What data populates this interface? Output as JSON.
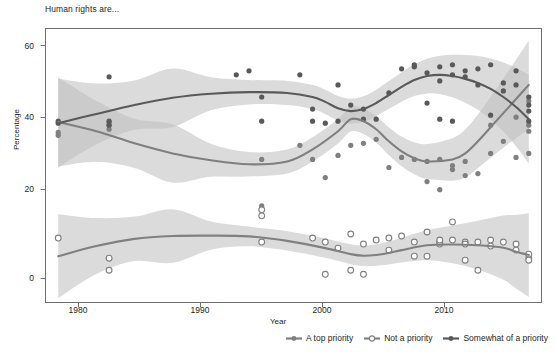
{
  "chart": {
    "title": "Human rights are...",
    "xlabel": "Year",
    "ylabel": "Percentage"
  },
  "axes": {
    "y_ticks": [
      "0",
      "20",
      "40",
      "60"
    ],
    "x_ticks": [
      "1980",
      "1990",
      "2000",
      "2010"
    ]
  },
  "legend": [
    {
      "label": "A top priority",
      "marker": "filled-circle-medium-gray",
      "color": "#7f7f7f"
    },
    {
      "label": "Not a priority",
      "marker": "open-circle",
      "color": "#808080"
    },
    {
      "label": "Somewhat of a priority",
      "marker": "filled-circle-dark-gray",
      "color": "#595959"
    }
  ],
  "chart_data": {
    "type": "scatter",
    "title": "Human rights are...",
    "xlabel": "Year",
    "ylabel": "Percentage",
    "xlim": [
      1978,
      2017
    ],
    "ylim": [
      -2,
      66
    ],
    "grid": false,
    "legend_position": "bottom-right",
    "smoother": "loess with shaded 95% confidence band",
    "series": [
      {
        "name": "A top priority",
        "color": "#7f7f7f",
        "marker": "filled-circle",
        "points": [
          [
            1979,
            39.5
          ],
          [
            1979,
            40.2
          ],
          [
            1983,
            42.0
          ],
          [
            1983,
            41.0
          ],
          [
            1983,
            42.8
          ],
          [
            1995,
            33.5
          ],
          [
            1995,
            22.0
          ],
          [
            1998,
            37.0
          ],
          [
            1999,
            33.5
          ],
          [
            2000,
            29.0
          ],
          [
            2001,
            34.5
          ],
          [
            2002,
            37.0
          ],
          [
            2003,
            37.5
          ],
          [
            2004,
            38.5
          ],
          [
            2005,
            31.5
          ],
          [
            2006,
            34.0
          ],
          [
            2007,
            33.5
          ],
          [
            2008,
            28.0
          ],
          [
            2008,
            33.0
          ],
          [
            2009,
            33.5
          ],
          [
            2009,
            26.0
          ],
          [
            2010,
            31.0
          ],
          [
            2010,
            32.0
          ],
          [
            2011,
            29.5
          ],
          [
            2011,
            33.0
          ],
          [
            2012,
            30.0
          ],
          [
            2013,
            35.0
          ],
          [
            2013,
            42.0
          ],
          [
            2014,
            38.0
          ],
          [
            2015,
            44.0
          ],
          [
            2015,
            34.0
          ],
          [
            2016,
            48.0
          ],
          [
            2016,
            42.0
          ],
          [
            2016,
            35.0
          ],
          [
            2016,
            40.5
          ]
        ],
        "trend": [
          [
            1979,
            42.8
          ],
          [
            1982,
            40.5
          ],
          [
            1985,
            37.5
          ],
          [
            1988,
            35.0
          ],
          [
            1991,
            33.3
          ],
          [
            1994,
            32.3
          ],
          [
            1997,
            33.0
          ],
          [
            1999,
            36.0
          ],
          [
            2001,
            40.5
          ],
          [
            2002,
            43.5
          ],
          [
            2003,
            43.0
          ],
          [
            2004,
            41.0
          ],
          [
            2005,
            38.0
          ],
          [
            2006,
            35.5
          ],
          [
            2007,
            33.8
          ],
          [
            2008,
            33.0
          ],
          [
            2010,
            33.5
          ],
          [
            2011,
            35.0
          ],
          [
            2012,
            38.0
          ],
          [
            2013,
            41.5
          ],
          [
            2014,
            45.0
          ],
          [
            2015,
            48.5
          ],
          [
            2016,
            52.0
          ]
        ]
      },
      {
        "name": "Not a priority",
        "color": "#808080",
        "marker": "open-circle",
        "points": [
          [
            1979,
            14.0
          ],
          [
            1983,
            9.0
          ],
          [
            1983,
            6.0
          ],
          [
            1995,
            13.0
          ],
          [
            1995,
            19.5
          ],
          [
            1995,
            21.0
          ],
          [
            1999,
            14.0
          ],
          [
            2000,
            13.0
          ],
          [
            2000,
            5.0
          ],
          [
            2001,
            11.5
          ],
          [
            2002,
            15.0
          ],
          [
            2002,
            6.0
          ],
          [
            2003,
            12.5
          ],
          [
            2003,
            5.0
          ],
          [
            2004,
            13.5
          ],
          [
            2005,
            11.0
          ],
          [
            2005,
            14.0
          ],
          [
            2006,
            14.5
          ],
          [
            2007,
            13.0
          ],
          [
            2007,
            9.5
          ],
          [
            2008,
            15.5
          ],
          [
            2008,
            9.5
          ],
          [
            2009,
            12.5
          ],
          [
            2009,
            13.0
          ],
          [
            2009,
            13.5
          ],
          [
            2010,
            13.5
          ],
          [
            2010,
            18.0
          ],
          [
            2011,
            13.0
          ],
          [
            2011,
            12.5
          ],
          [
            2011,
            8.5
          ],
          [
            2012,
            13.0
          ],
          [
            2012,
            6.0
          ],
          [
            2013,
            13.5
          ],
          [
            2013,
            12.0
          ],
          [
            2014,
            13.0
          ],
          [
            2015,
            12.5
          ],
          [
            2015,
            11.0
          ],
          [
            2016,
            9.0
          ],
          [
            2016,
            10.0
          ],
          [
            2016,
            8.5
          ]
        ],
        "trend": [
          [
            1979,
            9.5
          ],
          [
            1982,
            12.0
          ],
          [
            1985,
            13.8
          ],
          [
            1988,
            14.5
          ],
          [
            1991,
            14.6
          ],
          [
            1994,
            14.4
          ],
          [
            1997,
            13.3
          ],
          [
            2000,
            11.5
          ],
          [
            2002,
            10.0
          ],
          [
            2003,
            9.6
          ],
          [
            2004,
            9.8
          ],
          [
            2005,
            10.3
          ],
          [
            2006,
            11.0
          ],
          [
            2008,
            12.2
          ],
          [
            2010,
            12.4
          ],
          [
            2012,
            12.2
          ],
          [
            2014,
            11.6
          ],
          [
            2015,
            10.6
          ],
          [
            2016,
            9.8
          ]
        ]
      },
      {
        "name": "Somewhat of a priority",
        "color": "#595959",
        "marker": "filled-circle",
        "points": [
          [
            1979,
            43.0
          ],
          [
            1979,
            42.5
          ],
          [
            1983,
            54.0
          ],
          [
            1983,
            43.0
          ],
          [
            1983,
            42.0
          ],
          [
            1993,
            54.5
          ],
          [
            1994,
            55.5
          ],
          [
            1995,
            49.0
          ],
          [
            1995,
            43.0
          ],
          [
            1998,
            54.5
          ],
          [
            1999,
            46.0
          ],
          [
            1999,
            43.0
          ],
          [
            2000,
            42.5
          ],
          [
            2001,
            52.0
          ],
          [
            2001,
            43.0
          ],
          [
            2002,
            47.0
          ],
          [
            2003,
            46.0
          ],
          [
            2003,
            43.5
          ],
          [
            2004,
            43.5
          ],
          [
            2005,
            50.0
          ],
          [
            2006,
            56.0
          ],
          [
            2007,
            57.0
          ],
          [
            2007,
            56.5
          ],
          [
            2008,
            47.5
          ],
          [
            2008,
            55.0
          ],
          [
            2009,
            56.5
          ],
          [
            2009,
            53.0
          ],
          [
            2009,
            43.5
          ],
          [
            2010,
            57.0
          ],
          [
            2010,
            43.0
          ],
          [
            2010,
            54.5
          ],
          [
            2011,
            54.0
          ],
          [
            2011,
            55.5
          ],
          [
            2012,
            52.0
          ],
          [
            2012,
            56.0
          ],
          [
            2013,
            57.0
          ],
          [
            2013,
            44.5
          ],
          [
            2014,
            52.5
          ],
          [
            2014,
            50.5
          ],
          [
            2015,
            55.5
          ],
          [
            2015,
            52.0
          ],
          [
            2016,
            49.0
          ],
          [
            2016,
            45.5
          ],
          [
            2016,
            43.0
          ],
          [
            2016,
            47.0
          ]
        ],
        "trend": [
          [
            1979,
            42.5
          ],
          [
            1982,
            44.8
          ],
          [
            1985,
            47.0
          ],
          [
            1988,
            48.8
          ],
          [
            1991,
            49.8
          ],
          [
            1994,
            50.2
          ],
          [
            1997,
            50.0
          ],
          [
            1999,
            49.0
          ],
          [
            2000,
            47.8
          ],
          [
            2001,
            46.2
          ],
          [
            2002,
            45.5
          ],
          [
            2003,
            46.0
          ],
          [
            2004,
            47.5
          ],
          [
            2005,
            49.5
          ],
          [
            2006,
            51.5
          ],
          [
            2007,
            53.2
          ],
          [
            2008,
            54.2
          ],
          [
            2009,
            54.5
          ],
          [
            2010,
            54.2
          ],
          [
            2011,
            53.5
          ],
          [
            2012,
            52.5
          ],
          [
            2013,
            51.0
          ],
          [
            2014,
            49.0
          ],
          [
            2015,
            46.5
          ],
          [
            2016,
            43.5
          ]
        ]
      }
    ]
  }
}
